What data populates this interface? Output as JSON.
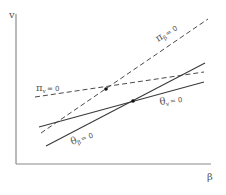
{
  "diagram": {
    "axes": {
      "origin": [
        16,
        164
      ],
      "y_axis_top": [
        16,
        14
      ],
      "x_axis_end": [
        211,
        164
      ],
      "y_label": "v",
      "x_label": "β",
      "y_label_pos": [
        9,
        18
      ],
      "x_label_pos": [
        207,
        180
      ]
    },
    "lines": [
      {
        "id": "pi_beta",
        "style": "dashed",
        "from": [
          41,
          133
        ],
        "to": [
          208,
          19
        ],
        "label": {
          "main": "π",
          "sub": "β",
          "eq": "= 0",
          "pos": [
            158,
            42
          ],
          "rotate": -32
        }
      },
      {
        "id": "pi_v",
        "style": "dashed",
        "from": [
          35,
          97
        ],
        "to": [
          204,
          72
        ],
        "label": {
          "main": "π",
          "sub": "v",
          "eq": "= 0",
          "pos": [
            36,
            91
          ],
          "rotate": 0
        }
      },
      {
        "id": "theta_v",
        "style": "solid",
        "from": [
          39,
          127
        ],
        "to": [
          204,
          82
        ],
        "label": {
          "main": "θ",
          "sub": "v",
          "eq": "= 0",
          "pos": [
            160,
            105
          ],
          "rotate": -8
        }
      },
      {
        "id": "theta_beta",
        "style": "solid",
        "from": [
          46,
          146
        ],
        "to": [
          205,
          63
        ],
        "label": {
          "main": "θ",
          "sub": "β",
          "eq": "= 0",
          "pos": [
            72,
            145
          ],
          "rotate": -20
        }
      }
    ],
    "equilibrium_points": [
      {
        "id": "pi-intersection",
        "pos": [
          106,
          89
        ]
      },
      {
        "id": "theta-intersection",
        "pos": [
          133,
          101
        ]
      }
    ]
  }
}
